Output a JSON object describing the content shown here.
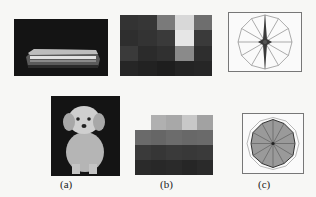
{
  "figure": {
    "captions": {
      "a": "(a)",
      "b": "(b)",
      "c": "(c)"
    },
    "rows": [
      {
        "image": {
          "subject": "locomotive",
          "background": "#141414"
        },
        "grid": {
          "cols": 5,
          "rows": 4,
          "cells": [
            [
              "#333333",
              "#363636",
              "#7a7a7a",
              "#d8d8d8",
              "#6e6e6e"
            ],
            [
              "#2e2e2e",
              "#333333",
              "#3a3a3a",
              "#e6e6e6",
              "#3a3a3a"
            ],
            [
              "#3a3a3a",
              "#2b2b2b",
              "#303030",
              "#8a8a8a",
              "#2e2e2e"
            ],
            [
              "#262626",
              "#222222",
              "#1e1e1e",
              "#242424",
              "#262626"
            ]
          ]
        },
        "polar": {
          "type": "star",
          "spokes": 12,
          "frame": true
        }
      },
      {
        "image": {
          "subject": "dog",
          "background": "#141414"
        },
        "grid": {
          "cols": 5,
          "rows": 4,
          "top_row_offset_cols": 1,
          "cells": [
            [
              null,
              "#b0b0b0",
              "#a8a8a8",
              "#c8c8c8",
              "#a2a2a2"
            ],
            [
              "#6a6a6a",
              "#666666",
              "#6c6c6c",
              "#686868",
              "#6a6a6a"
            ],
            [
              "#3a3a3a",
              "#363636",
              "#3a3a3a",
              "#383838",
              "#3a3a3a"
            ],
            [
              "#2a2a2a",
              "#282828",
              "#2a2a2a",
              "#262626",
              "#2a2a2a"
            ]
          ]
        },
        "polar": {
          "type": "filled-polygon",
          "spokes": 12,
          "fill": "#9a9a9a",
          "frame": true
        }
      }
    ]
  }
}
